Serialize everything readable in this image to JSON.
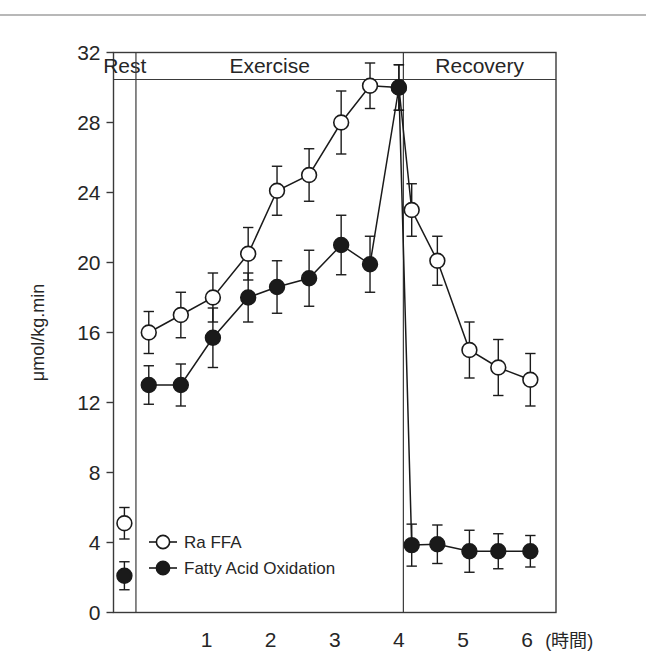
{
  "figure": {
    "y_axis_title": "μmol/kg.min",
    "x_axis_unit_label": "(時間)",
    "y_ticks": [
      "0",
      "4",
      "8",
      "12",
      "16",
      "20",
      "24",
      "28",
      "32"
    ],
    "x_ticks": [
      "1",
      "2",
      "3",
      "4",
      "5",
      "6"
    ],
    "phases": [
      {
        "name": "rest",
        "label": "Rest"
      },
      {
        "name": "exercise",
        "label": "Exercise"
      },
      {
        "name": "recovery",
        "label": "Recovery"
      }
    ],
    "legend": [
      {
        "name": "ra-ffa",
        "label": "Ra FFA",
        "marker": "open-circle"
      },
      {
        "name": "fatty-acid-oxidation",
        "label": "Fatty Acid Oxidation",
        "marker": "filled-circle"
      }
    ],
    "colors": {
      "line": "#1a1a1a",
      "frame": "#3a3a3a",
      "text": "#262626",
      "top_rule": "#b8b8b8",
      "open_marker_fill": "#ffffff"
    }
  },
  "chart_data": {
    "type": "line",
    "title": "",
    "subtitle": "",
    "xlabel": "(時間)",
    "ylabel": "μmol/kg.min",
    "xlim": [
      -0.45,
      6.45
    ],
    "ylim": [
      0,
      32
    ],
    "y_ticks": [
      0,
      4,
      8,
      12,
      16,
      20,
      24,
      28,
      32
    ],
    "x_ticks": [
      1,
      2,
      3,
      4,
      5,
      6
    ],
    "grid": false,
    "legend_position": "bottom-left inside axes",
    "error_bars": "symmetric, capped",
    "phase_regions": [
      {
        "label": "Rest",
        "x_start": -0.45,
        "x_end": -0.1
      },
      {
        "label": "Exercise",
        "x_start": -0.1,
        "x_end": 4.07
      },
      {
        "label": "Recovery",
        "x_start": 4.07,
        "x_end": 6.45
      }
    ],
    "series": [
      {
        "name": "Ra FFA",
        "marker": "open-circle",
        "rest_point": {
          "x": -0.28,
          "y": 5.1,
          "err": 0.9
        },
        "x": [
          0.1,
          0.6,
          1.1,
          1.65,
          2.1,
          2.6,
          3.1,
          3.55,
          4.0,
          4.2,
          4.6,
          5.1,
          5.55,
          6.05
        ],
        "values": [
          16.0,
          17.0,
          18.0,
          20.5,
          24.1,
          25.0,
          28.0,
          30.1,
          30.0,
          23.0,
          20.1,
          15.0,
          14.0,
          13.3
        ],
        "errors": [
          1.2,
          1.3,
          1.4,
          1.5,
          1.4,
          1.5,
          1.8,
          1.3,
          1.3,
          1.5,
          1.4,
          1.6,
          1.6,
          1.5
        ]
      },
      {
        "name": "Fatty Acid Oxidation",
        "marker": "filled-circle",
        "rest_point": {
          "x": -0.28,
          "y": 2.1,
          "err": 0.8
        },
        "x": [
          0.1,
          0.6,
          1.1,
          1.65,
          2.1,
          2.6,
          3.1,
          3.55,
          4.0,
          4.2,
          4.6,
          5.1,
          5.55,
          6.05
        ],
        "values": [
          13.0,
          13.0,
          15.7,
          18.0,
          18.6,
          19.1,
          21.0,
          19.9,
          30.0,
          3.85,
          3.9,
          3.5,
          3.5,
          3.5
        ],
        "errors": [
          1.1,
          1.2,
          1.7,
          1.4,
          1.5,
          1.6,
          1.7,
          1.6,
          1.3,
          1.2,
          1.1,
          1.2,
          1.0,
          0.9
        ]
      }
    ]
  }
}
